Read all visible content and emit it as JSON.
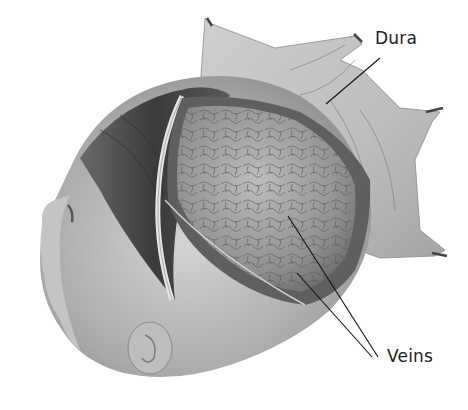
{
  "figure": {
    "labels": [
      {
        "id": "dura",
        "text": "Dura",
        "x": 375,
        "y": 28
      },
      {
        "id": "veins",
        "text": "Veins",
        "x": 387,
        "y": 346
      }
    ],
    "leader_lines": [
      {
        "label": "dura",
        "x1": 380,
        "y1": 58,
        "x2": 326,
        "y2": 104
      },
      {
        "label": "veins",
        "x1": 378,
        "y1": 357,
        "x2": 288,
        "y2": 216
      },
      {
        "label": "veins",
        "x1": 372,
        "y1": 357,
        "x2": 297,
        "y2": 273
      }
    ],
    "colors": {
      "background": "#ffffff",
      "skin": "#b9b9b9",
      "hair": "#4a4a4a",
      "dura": "#c8c8c8",
      "brain": "#9a9a9a",
      "line": "#111111"
    }
  }
}
